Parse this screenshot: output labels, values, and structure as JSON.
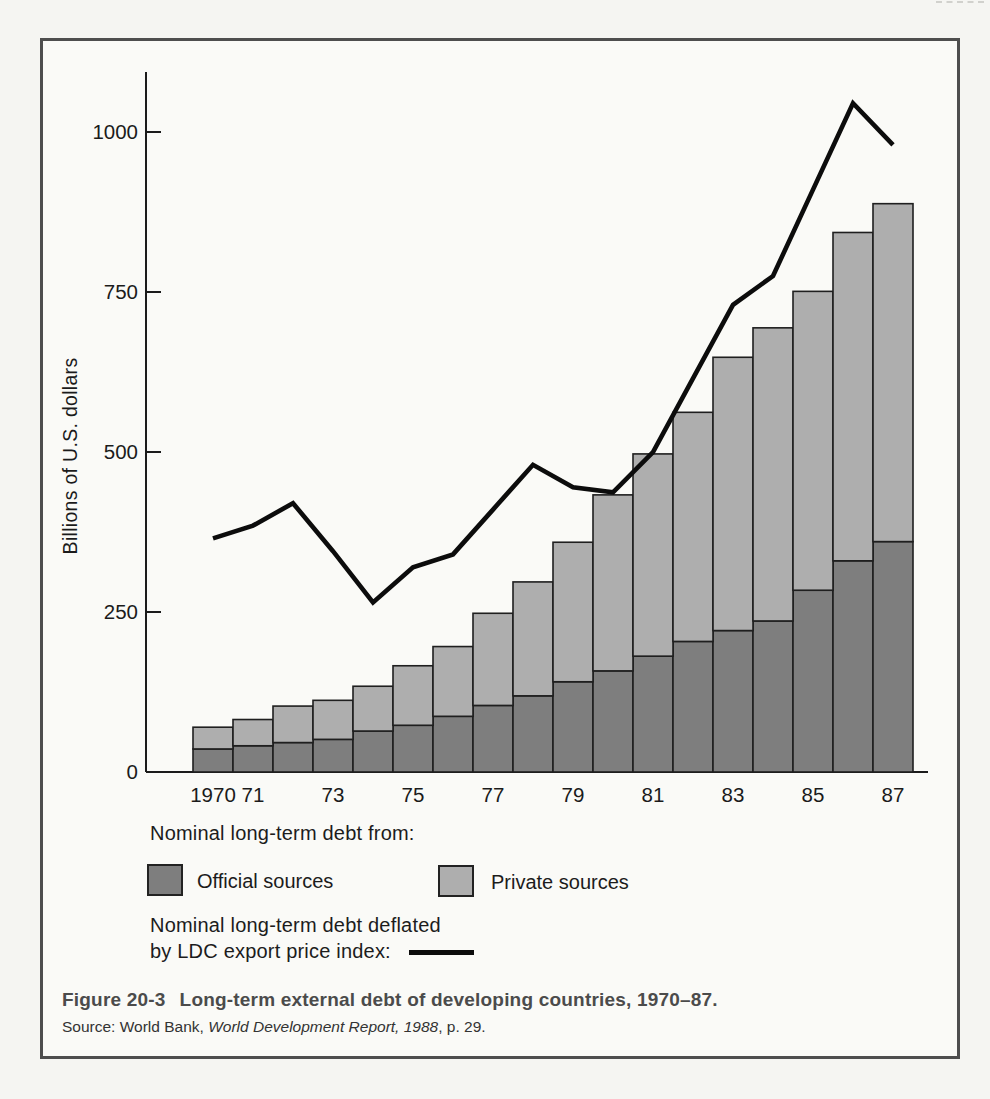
{
  "figure": {
    "caption_label": "Figure 20-3",
    "caption_title": "Long-term external debt of developing countries, 1970–87.",
    "source_prefix": "Source: World Bank, ",
    "source_italic": "World Development Report, 1988",
    "source_suffix": ", p. 29."
  },
  "legend": {
    "bars_heading": "Nominal long-term debt from:",
    "official_label": "Official sources",
    "private_label": "Private sources",
    "line_heading_line1": "Nominal long-term debt deflated",
    "line_heading_line2": "by LDC export price index:"
  },
  "chart_data": {
    "type": "bar",
    "subtype": "stacked-bar-with-line",
    "title": "",
    "xlabel": "",
    "ylabel": "Billions of U.S. dollars",
    "ylim": [
      0,
      1095
    ],
    "yticks": [
      0,
      250,
      500,
      750,
      1000
    ],
    "grid": false,
    "legend_position": "below",
    "categories": [
      "1970",
      "1971",
      "1972",
      "1973",
      "1974",
      "1975",
      "1976",
      "1977",
      "1978",
      "1979",
      "1980",
      "1981",
      "1982",
      "1983",
      "1984",
      "1985",
      "1986",
      "1987"
    ],
    "x_tick_labels": [
      "1970",
      "71",
      "",
      "73",
      "",
      "75",
      "",
      "77",
      "",
      "79",
      "",
      "81",
      "",
      "83",
      "",
      "85",
      "",
      "87"
    ],
    "series": [
      {
        "name": "Official sources",
        "type": "bar-stack",
        "color": "#7e7e7e",
        "values": [
          36,
          41,
          46,
          51,
          64,
          73,
          87,
          104,
          119,
          141,
          158,
          181,
          204,
          221,
          236,
          284,
          330,
          360
        ]
      },
      {
        "name": "Private sources",
        "type": "bar-stack",
        "color": "#aeaeae",
        "values": [
          34,
          41,
          57,
          61,
          70,
          93,
          109,
          144,
          178,
          218,
          275,
          316,
          358,
          427,
          458,
          467,
          513,
          528
        ]
      },
      {
        "name": "Nominal long-term debt deflated by LDC export price index",
        "type": "line",
        "color": "#0c0c0c",
        "values": [
          365,
          385,
          420,
          345,
          265,
          320,
          340,
          410,
          480,
          445,
          437,
          500,
          615,
          730,
          775,
          910,
          1045,
          980
        ]
      }
    ],
    "stacked_totals": [
      70,
      82,
      103,
      112,
      134,
      166,
      196,
      248,
      297,
      359,
      433,
      497,
      562,
      648,
      694,
      751,
      843,
      888
    ]
  }
}
